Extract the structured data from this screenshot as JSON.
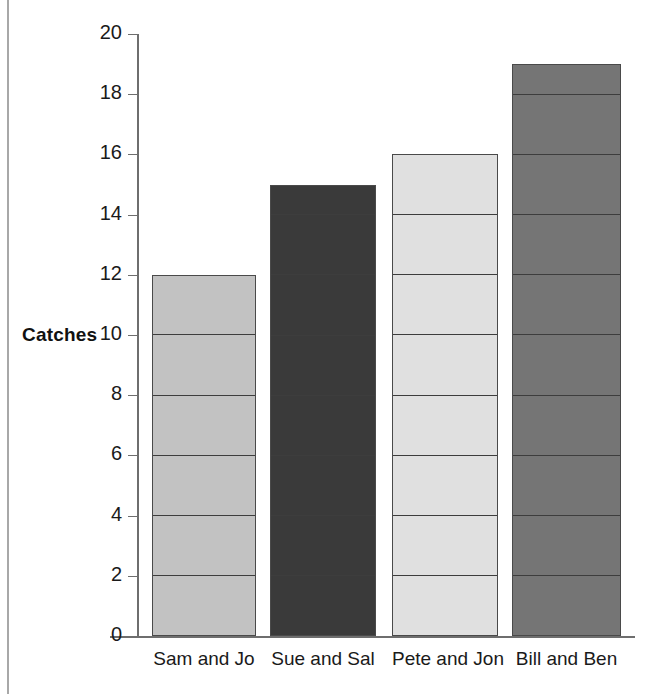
{
  "chart_data": {
    "type": "bar",
    "title": "",
    "xlabel": "",
    "ylabel": "Catches",
    "categories": [
      "Sam and Jo",
      "Sue and Sal",
      "Pete and Jon",
      "Bill and Ben"
    ],
    "values": [
      12,
      15,
      16,
      19
    ],
    "ylim": [
      0,
      20
    ],
    "ytick_step": 2,
    "yticks": [
      20,
      18,
      16,
      14,
      12,
      10,
      8,
      6,
      4,
      2,
      0
    ],
    "ytick_labels": [
      "20",
      "18",
      "16",
      "14",
      "12",
      "10",
      "8",
      "6",
      "4",
      "2",
      "0"
    ],
    "grid": "horizontal-rules-inside-bars-every-2-units",
    "legend": "none",
    "bar_colors": [
      "#c2c2c2",
      "#3a3a3a",
      "#e0e0e0",
      "#757575"
    ],
    "bar_outline_color": "#4a4a4a",
    "axis_color": "#6e6e6e",
    "text_color": "#1a1a1a",
    "background": "#ffffff",
    "series": [
      {
        "name": "Catches",
        "points": [
          {
            "category": "Sam and Jo",
            "value": 12,
            "color": "#c2c2c2"
          },
          {
            "category": "Sue and Sal",
            "value": 15,
            "color": "#3a3a3a"
          },
          {
            "category": "Pete and Jon",
            "value": 16,
            "color": "#e0e0e0"
          },
          {
            "category": "Bill and Ben",
            "value": 19,
            "color": "#757575"
          }
        ]
      }
    ]
  }
}
